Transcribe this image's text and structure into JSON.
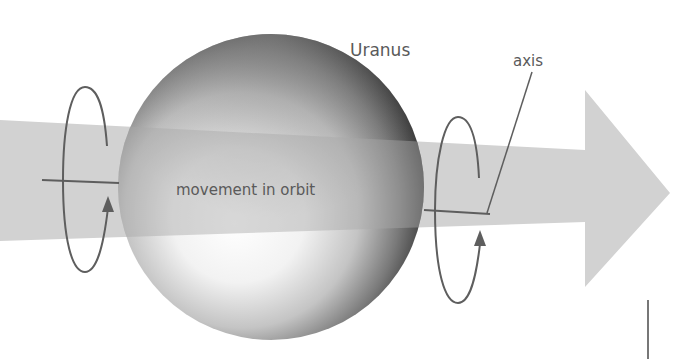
{
  "diagram": {
    "labels": {
      "planet": "Uranus",
      "axis": "axis",
      "movement": "movement in orbit"
    },
    "elements": {
      "planet": {
        "name": "Uranus",
        "shape": "sphere",
        "shading": "grayscale gradient"
      },
      "orbit_arrow": {
        "direction": "right",
        "color": "#cfcfcf"
      },
      "rotation_arrows": [
        {
          "side": "left",
          "direction": "upward on front"
        },
        {
          "side": "right",
          "direction": "upward on front"
        }
      ],
      "axis_line": {
        "orientation": "nearly horizontal"
      }
    },
    "colors": {
      "arrow_fill": "#d0d0d0",
      "line": "#5e5e5e",
      "text": "#5a5a5a",
      "background": "#ffffff"
    }
  }
}
